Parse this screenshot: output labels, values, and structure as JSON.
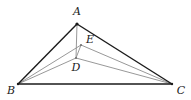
{
  "figure": {
    "type": "geometry-diagram",
    "background_color": "#ffffff",
    "outline_color": "#1a1a1a",
    "inner_line_color": "#8c8c8c",
    "label_color": "#1a1a1a",
    "points": [
      {
        "name": "A",
        "label": "A",
        "x": 77,
        "y": 24,
        "label_x": 77,
        "label_y": 12
      },
      {
        "name": "B",
        "label": "B",
        "x": 18,
        "y": 84,
        "label_x": 11,
        "label_y": 91
      },
      {
        "name": "C",
        "label": "C",
        "x": 172,
        "y": 84,
        "label_x": 181,
        "label_y": 91
      },
      {
        "name": "D",
        "label": "D",
        "x": 76,
        "y": 58,
        "label_x": 76,
        "label_y": 68
      },
      {
        "name": "E",
        "label": "E",
        "x": 81,
        "y": 45,
        "label_x": 90,
        "label_y": 40
      }
    ],
    "segments": [
      {
        "name": "side-AB",
        "from": "A",
        "to": "B",
        "style": "outline"
      },
      {
        "name": "side-AC",
        "from": "A",
        "to": "C",
        "style": "outline"
      },
      {
        "name": "side-BC",
        "from": "B",
        "to": "C",
        "style": "outline"
      },
      {
        "name": "cevian-AD",
        "from": "A",
        "to": "D",
        "style": "inner"
      },
      {
        "name": "cevian-BE",
        "from": "B",
        "to": "E",
        "style": "inner"
      },
      {
        "name": "cevian-BD",
        "from": "B",
        "to": "D",
        "style": "inner"
      },
      {
        "name": "cevian-CE",
        "from": "C",
        "to": "E",
        "style": "inner"
      },
      {
        "name": "cevian-CD",
        "from": "C",
        "to": "D",
        "style": "inner"
      },
      {
        "name": "segment-ED",
        "from": "E",
        "to": "D",
        "style": "inner"
      }
    ]
  }
}
